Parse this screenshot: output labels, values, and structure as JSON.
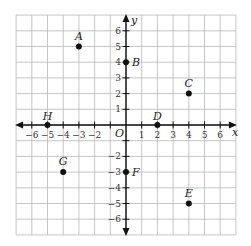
{
  "chart_data": {
    "type": "scatter",
    "title": "",
    "xlabel": "x",
    "ylabel": "y",
    "origin_label": "O",
    "xlim": [
      -7,
      7
    ],
    "ylim": [
      -7,
      7
    ],
    "grid": true,
    "x_ticks": [
      -6,
      -5,
      -4,
      -3,
      -2,
      1,
      2,
      3,
      4,
      5,
      6
    ],
    "y_ticks": [
      6,
      5,
      4,
      3,
      2,
      1,
      -2,
      -3,
      -4,
      -5,
      -6
    ],
    "points": [
      {
        "label": "A",
        "x": -3,
        "y": 5
      },
      {
        "label": "B",
        "x": 0,
        "y": 4
      },
      {
        "label": "C",
        "x": 4,
        "y": 2
      },
      {
        "label": "D",
        "x": 2,
        "y": 0
      },
      {
        "label": "E",
        "x": 4,
        "y": -5
      },
      {
        "label": "F",
        "x": 0,
        "y": -3
      },
      {
        "label": "G",
        "x": -4,
        "y": -3
      },
      {
        "label": "H",
        "x": -5,
        "y": 0
      }
    ]
  },
  "colors": {
    "grid": "#b8b8b8",
    "axis": "#111111",
    "point": "#111111"
  }
}
